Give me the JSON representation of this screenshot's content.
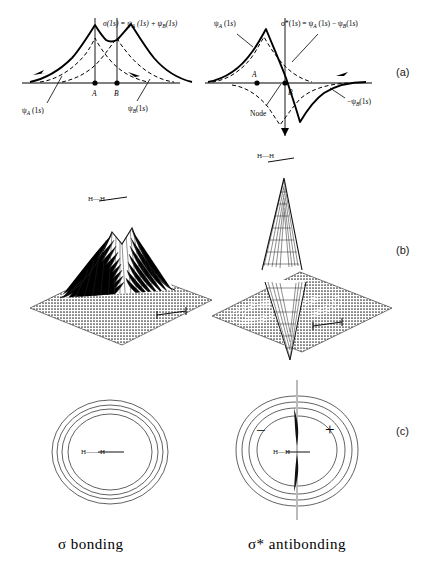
{
  "figure": {
    "title_rows": [
      "(a)",
      "(b)",
      "(c)"
    ],
    "row_labels": [
      {
        "label": "(a)",
        "x": 396,
        "y": 66
      },
      {
        "label": "(b)",
        "x": 396,
        "y": 244
      },
      {
        "label": "(c)",
        "x": 396,
        "y": 425
      }
    ]
  },
  "row_a": {
    "left": {
      "equation": "σ(1s) = ψ",
      "equation_full": "σ(1s) = ψA (1s) + ψB (1s)",
      "sigma_symbol": "σ",
      "sigma_arg": "(1s) =",
      "psi": "ψ",
      "subA": "A",
      "subB": "B",
      "arg": "(1s)",
      "plus": "+",
      "label_left": "ψA (1s)",
      "label_right": "ψB (1s)",
      "nucleus_a": "A",
      "nucleus_b": "B"
    },
    "right": {
      "equation_full": "σ*(1s) = ψA (1s) − ψB (1s)",
      "sigma_symbol": "σ*",
      "minus": "−",
      "label_left": "ψA (1s)",
      "label_right": "−ψB (1s)",
      "node_label": "Node",
      "nucleus_a": "A",
      "nucleus_b": "B"
    }
  },
  "row_b": {
    "left": {
      "molecule_label": "H—H"
    },
    "right": {
      "molecule_label": "H—H"
    }
  },
  "row_c": {
    "left": {
      "molecule_label": "H——H"
    },
    "right": {
      "molecule_label": "H—H",
      "sign_negative": "−",
      "sign_positive": "+"
    }
  },
  "captions": {
    "bonding": "σ  bonding",
    "antibonding": "σ*  antibonding"
  },
  "colors": {
    "ink": "#000000",
    "mesh": "#2b2b2b",
    "contour": "#3a3a3a",
    "label": "#1a1a1a"
  }
}
